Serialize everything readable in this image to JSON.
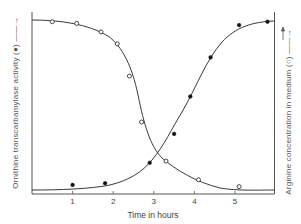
{
  "chart_data": {
    "type": "line",
    "title": "",
    "xlabel": "Time in hours",
    "ylabel_left": "Ornithine transcarbamylase activity (●) —→",
    "ylabel_right": "Arginine concentration in medium (○) —→",
    "x_ticks": [
      "1",
      "2",
      "3",
      "4",
      "5"
    ],
    "xlim": [
      0,
      6
    ],
    "ylim": [
      0,
      100
    ],
    "y_units": "relative (no tick values shown)",
    "grid": false,
    "legend": "markers explained in axis labels (filled = enzyme activity, open = arginine)",
    "series": [
      {
        "name": "Ornithine transcarbamylase activity",
        "marker": "filled-circle",
        "axis": "left",
        "x": [
          1.0,
          1.8,
          2.9,
          3.5,
          3.9,
          4.4,
          5.1,
          5.8
        ],
        "y": [
          3,
          4,
          16,
          33,
          55,
          78,
          97,
          99
        ]
      },
      {
        "name": "Arginine concentration in medium",
        "marker": "open-circle",
        "axis": "right",
        "x": [
          0.5,
          1.1,
          1.7,
          2.1,
          2.4,
          2.7,
          3.3,
          4.1,
          5.1
        ],
        "y": [
          99,
          98,
          93,
          86,
          67,
          40,
          17,
          6,
          2
        ]
      }
    ]
  },
  "labels": {
    "xlabel": "Time in hours",
    "ylabel_left": "Ornithine transcarbamylase activity (●) ——→",
    "ylabel_right": "Arginine concentration in medium (○) ——→",
    "ticks": [
      "1",
      "2",
      "3",
      "4",
      "5"
    ]
  },
  "colors": {
    "line": "#3a3a3a",
    "marker_fill_filled": "#111111",
    "marker_fill_open": "#ffffff",
    "axis": "#555555"
  }
}
